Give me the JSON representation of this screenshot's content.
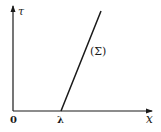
{
  "diagram": {
    "axes": {
      "vertical_label": "τ",
      "horizontal_label": "x",
      "origin_label": "0"
    },
    "intercept_label": "λ",
    "line_label": "(Σ)",
    "colors": {
      "ink": "#1a1a1a",
      "background": "#ffffff"
    }
  }
}
